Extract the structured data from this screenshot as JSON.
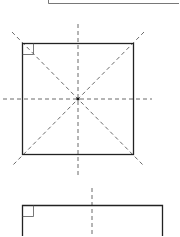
{
  "diagram": {
    "title": "",
    "colors": {
      "line": "#222222",
      "dash": "#444444",
      "background": "#ffffff"
    },
    "figures": [
      {
        "name": "top-partial-rectangle",
        "kind": "rectangle",
        "visible": "bottom-left corner only"
      },
      {
        "name": "square",
        "kind": "square",
        "right_angle_marker": true,
        "symmetry_lines": [
          "diagonal-1",
          "diagonal-2",
          "horizontal",
          "vertical"
        ],
        "center_point": true
      },
      {
        "name": "bottom-rectangle",
        "kind": "rectangle",
        "right_angle_marker": true,
        "symmetry_lines": [
          "vertical"
        ],
        "visible": "top portion only"
      }
    ]
  }
}
